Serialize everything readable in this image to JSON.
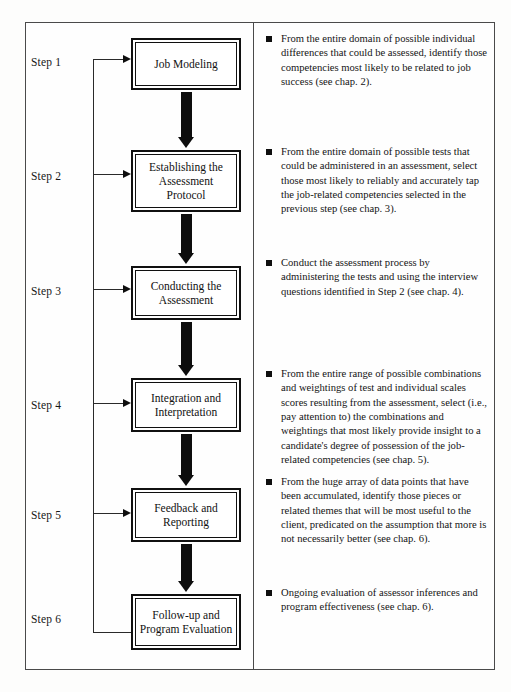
{
  "figure": {
    "steps": [
      {
        "step_label": "Step 1",
        "node_label": "Job Modeling",
        "bullet": "From the entire domain of possible individual differences that could be assessed, identify those competencies most likely to be related to job success (see chap. 2)."
      },
      {
        "step_label": "Step 2",
        "node_label": "Establishing the Assessment Protocol",
        "bullet": "From the entire domain of possible tests that could be administered in an assessment, select those most likely to reliably and accurately tap the job-related competencies selected in the previous step (see chap. 3)."
      },
      {
        "step_label": "Step 3",
        "node_label": "Conducting the Assessment",
        "bullet": "Conduct the assessment process by administering the tests and using the interview questions identified in Step 2 (see chap. 4)."
      },
      {
        "step_label": "Step 4",
        "node_label": "Integration and Interpretation",
        "bullet": "From the entire range of possible combinations and weightings of test and individual scales scores resulting from the assessment, select (i.e., pay attention to) the combinations and weightings that most likely provide insight to a candidate's degree of possession of the job-related competencies (see chap. 5)."
      },
      {
        "step_label": "Step 5",
        "node_label": "Feedback and Reporting",
        "bullet": "From the huge array of data points that have been accumulated, identify those pieces or related themes that will be most useful to the client, predicated on the assumption that more is not necessarily better (see chap. 6)."
      },
      {
        "step_label": "Step 6",
        "node_label": "Follow-up and Program Evaluation",
        "bullet": "Ongoing evaluation of assessor inferences and program effectiveness (see chap. 6)."
      }
    ],
    "icons": {
      "bullet_marker": "filled-square-bullet",
      "flow_arrow": "thick-down-arrow",
      "feedback_arrow": "right-arrow"
    },
    "colors": {
      "ink": "#111111",
      "frame": "#4a4a4a",
      "page": "#fdfdfc"
    }
  }
}
